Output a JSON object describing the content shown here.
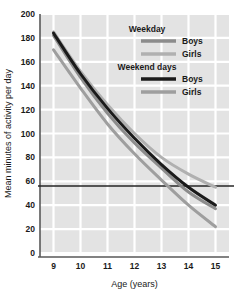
{
  "chart_data": {
    "type": "line",
    "title": "",
    "xlabel": "Age (years)",
    "ylabel": "Mean minutes of activity per day",
    "xlim": [
      8.5,
      15.5
    ],
    "ylim": [
      0,
      200
    ],
    "xticks": [
      "9",
      "10",
      "11",
      "12",
      "13",
      "14",
      "15"
    ],
    "yticks": [
      "0",
      "20",
      "40",
      "60",
      "80",
      "100",
      "120",
      "140",
      "160",
      "180",
      "200"
    ],
    "x": [
      9,
      10,
      11,
      12,
      13,
      14,
      15
    ],
    "grid": true,
    "legend_position": "top-right",
    "reference_line": {
      "orientation": "horizontal",
      "value": 56,
      "color": "#262626"
    },
    "series": [
      {
        "name": "Weekday Boys",
        "group": "Weekday",
        "label": "Boys",
        "color": "#8c8c8c",
        "values": [
          182,
          147,
          117,
          92,
          71,
          51,
          37
        ]
      },
      {
        "name": "Weekday Girls",
        "group": "Weekday",
        "label": "Girls",
        "color": "#b0b0b0",
        "values": [
          185,
          152,
          124,
          100,
          80,
          66,
          55
        ]
      },
      {
        "name": "Weekend days Boys",
        "group": "Weekend days",
        "label": "Boys",
        "color": "#1a1a1a",
        "values": [
          184,
          150,
          121,
          96,
          74,
          55,
          40
        ]
      },
      {
        "name": "Weekend days Girls",
        "group": "Weekend days",
        "label": "Girls",
        "color": "#9e9e9e",
        "values": [
          170,
          138,
          108,
          83,
          61,
          40,
          22
        ]
      }
    ],
    "legend": [
      {
        "type": "header",
        "text": "Weekday"
      },
      {
        "type": "entry",
        "text": "Boys",
        "color": "#8c8c8c"
      },
      {
        "type": "entry",
        "text": "Girls",
        "color": "#b0b0b0"
      },
      {
        "type": "header",
        "text": "Weekend days"
      },
      {
        "type": "entry",
        "text": "Boys",
        "color": "#1a1a1a"
      },
      {
        "type": "entry",
        "text": "Girls",
        "color": "#9e9e9e"
      }
    ],
    "colors": {
      "plot_background": "#e3e3e3",
      "gridline": "#ffffff",
      "axis": "#595959",
      "text": "#1a1a1a"
    }
  }
}
